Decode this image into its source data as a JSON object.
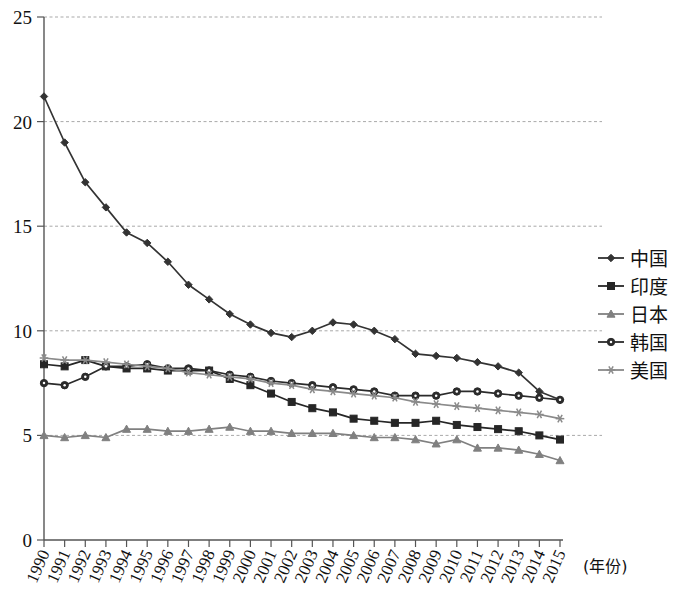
{
  "chart_data": {
    "type": "line",
    "title": "",
    "xlabel": "(年份)",
    "ylabel": "",
    "ylim": [
      0,
      25
    ],
    "yticks": [
      0,
      5,
      10,
      15,
      20,
      25
    ],
    "grid": true,
    "grid_axis": "y",
    "legend_position": "right",
    "categories": [
      "1990",
      "1991",
      "1992",
      "1993",
      "1994",
      "1995",
      "1996",
      "1997",
      "1998",
      "1999",
      "2000",
      "2001",
      "2002",
      "2003",
      "2004",
      "2005",
      "2006",
      "2007",
      "2008",
      "2009",
      "2010",
      "2011",
      "2012",
      "2013",
      "2014",
      "2015"
    ],
    "series": [
      {
        "name": "中国",
        "marker": "diamond",
        "color": "#333333",
        "values": [
          21.2,
          19.0,
          17.1,
          15.9,
          14.7,
          14.2,
          13.3,
          12.2,
          11.5,
          10.8,
          10.3,
          9.9,
          9.7,
          10.0,
          10.4,
          10.3,
          10.0,
          9.6,
          8.9,
          8.8,
          8.7,
          8.5,
          8.3,
          8.0,
          7.1,
          6.7
        ]
      },
      {
        "name": "印度",
        "marker": "square",
        "color": "#262626",
        "values": [
          8.4,
          8.3,
          8.6,
          8.3,
          8.2,
          8.2,
          8.1,
          8.1,
          8.1,
          7.7,
          7.4,
          7.0,
          6.6,
          6.3,
          6.1,
          5.8,
          5.7,
          5.6,
          5.6,
          5.7,
          5.5,
          5.4,
          5.3,
          5.2,
          5.0,
          4.8
        ]
      },
      {
        "name": "日本",
        "marker": "triangle",
        "color": "#808080",
        "values": [
          5.0,
          4.9,
          5.0,
          4.9,
          5.3,
          5.3,
          5.2,
          5.2,
          5.3,
          5.4,
          5.2,
          5.2,
          5.1,
          5.1,
          5.1,
          5.0,
          4.9,
          4.9,
          4.8,
          4.6,
          4.8,
          4.4,
          4.4,
          4.3,
          4.1,
          3.8
        ]
      },
      {
        "name": "韩国",
        "marker": "circle",
        "color": "#2b2b2b",
        "values": [
          7.5,
          7.4,
          7.8,
          8.3,
          8.3,
          8.4,
          8.2,
          8.2,
          8.1,
          7.9,
          7.8,
          7.6,
          7.5,
          7.4,
          7.3,
          7.2,
          7.1,
          6.9,
          6.9,
          6.9,
          7.1,
          7.1,
          7.0,
          6.9,
          6.8,
          6.7
        ]
      },
      {
        "name": "美国",
        "marker": "asterisk",
        "color": "#8a8a8a",
        "values": [
          8.7,
          8.6,
          8.6,
          8.5,
          8.4,
          8.3,
          8.2,
          8.0,
          7.9,
          7.8,
          7.7,
          7.5,
          7.4,
          7.2,
          7.1,
          7.0,
          6.9,
          6.8,
          6.6,
          6.5,
          6.4,
          6.3,
          6.2,
          6.1,
          6.0,
          5.8
        ]
      }
    ]
  },
  "axes": {
    "y_tick_labels": [
      "25",
      "20",
      "15",
      "10",
      "5",
      "0"
    ],
    "x_tick_labels": [
      "1990",
      "1991",
      "1992",
      "1993",
      "1994",
      "1995",
      "1996",
      "1997",
      "1998",
      "1999",
      "2000",
      "2001",
      "2002",
      "2003",
      "2004",
      "2005",
      "2006",
      "2007",
      "2008",
      "2009",
      "2010",
      "2011",
      "2012",
      "2013",
      "2014",
      "2015"
    ],
    "x_axis_title": "(年份)"
  },
  "legend": {
    "items": [
      {
        "label": "中国",
        "marker": "diamond-icon"
      },
      {
        "label": "印度",
        "marker": "square-icon"
      },
      {
        "label": "日本",
        "marker": "triangle-icon"
      },
      {
        "label": "韩国",
        "marker": "circle-icon"
      },
      {
        "label": "美国",
        "marker": "asterisk-icon"
      }
    ]
  }
}
